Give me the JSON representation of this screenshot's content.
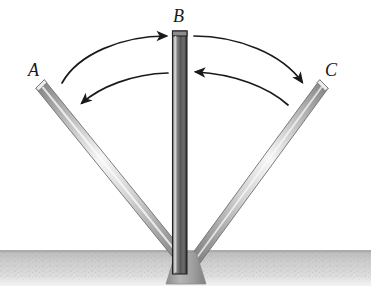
{
  "figure": {
    "background_color": "#ffffff",
    "width": 371,
    "height": 306
  },
  "labels": {
    "a": "A",
    "b": "B",
    "c": "C"
  },
  "rods": [
    {
      "id": "rod-a",
      "label": "A",
      "position": "left",
      "angle_deg": -45,
      "tip": {
        "x": 40,
        "y": 84
      },
      "pivot": {
        "x": 186,
        "y": 264
      },
      "half_width": 6,
      "edge_color": "#8d8d8d",
      "core_color": "#f2f2f2",
      "outline_color": "#6b6b6b"
    },
    {
      "id": "rod-b",
      "label": "B",
      "position": "center",
      "angle_deg": 0,
      "tip": {
        "x": 180,
        "y": 31
      },
      "pivot": {
        "x": 180,
        "y": 264
      },
      "half_width": 7,
      "edge_color": "#9a9a9a",
      "core_color": "#4a4a4a",
      "outline_color": "#2e2e2e"
    },
    {
      "id": "rod-c",
      "label": "C",
      "position": "right",
      "angle_deg": 45,
      "tip": {
        "x": 324,
        "y": 84
      },
      "pivot": {
        "x": 192,
        "y": 264
      },
      "half_width": 6,
      "edge_color": "#8d8d8d",
      "core_color": "#f2f2f2",
      "outline_color": "#6b6b6b"
    }
  ],
  "arrows": [
    {
      "id": "arc-a-to-b",
      "from": "A",
      "to": "B",
      "direction": "right",
      "description": "outer left arc, arrowhead at B"
    },
    {
      "id": "arc-b-to-a",
      "from": "B",
      "to": "A",
      "direction": "left",
      "description": "inner left arc, arrowhead at A"
    },
    {
      "id": "arc-b-to-c",
      "from": "B",
      "to": "C",
      "direction": "right",
      "description": "outer right arc, arrowhead at C"
    },
    {
      "id": "arc-c-to-b",
      "from": "C",
      "to": "B",
      "direction": "left",
      "description": "inner right arc, arrowhead at B"
    }
  ],
  "ground": {
    "top_y": 250,
    "bottom_y": 286,
    "color": "#c9c9c9",
    "speckle_color": "#9b9b9b",
    "label": "ground surface"
  },
  "pivot_base": {
    "center_x": 186,
    "top_y": 252,
    "bottom_y": 285,
    "top_half_width": 10,
    "bottom_half_width": 20,
    "color": "#9f9f9f",
    "label": "pivot base"
  },
  "colors": {
    "stroke_dark": "#1a1a1a",
    "rod_light": "#f5f5f5",
    "rod_mid": "#a8a8a8",
    "rod_dark": "#555555",
    "ground": "#c9c9c9"
  }
}
